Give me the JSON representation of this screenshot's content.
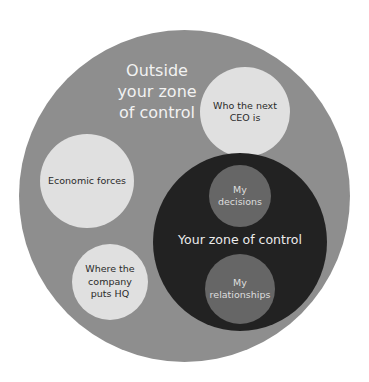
{
  "diagram": {
    "type": "nested-circles",
    "outer_zone": {
      "label": "Outside\nyour zone\nof control",
      "color": "#8e8e8e",
      "items": [
        {
          "label": "Who the next\nCEO is",
          "color": "#e0e0e0"
        },
        {
          "label": "Economic forces",
          "color": "#e0e0e0"
        },
        {
          "label": "Where the\ncompany\nputs HQ",
          "color": "#e0e0e0"
        }
      ]
    },
    "inner_zone": {
      "label": "Your zone of control",
      "color": "#222222",
      "items": [
        {
          "label": "My\ndecisions",
          "color": "#666666"
        },
        {
          "label": "My\nrelationships",
          "color": "#666666"
        }
      ]
    }
  }
}
